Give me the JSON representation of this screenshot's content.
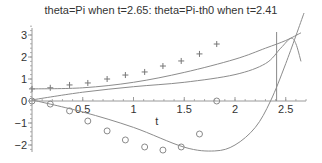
{
  "chart_data": {
    "type": "line",
    "title": "theta=Pi when t=2.65:  theta=Pi-th0 when t=2.41",
    "xlabel": "t",
    "ylabel": "",
    "xlim": [
      0,
      2.7
    ],
    "ylim": [
      -2.2,
      3.4
    ],
    "x_ticks": [
      "0.5",
      "1",
      "1.5",
      "2",
      "2.5"
    ],
    "y_ticks": [
      "3",
      "2",
      "1",
      "0",
      "-1",
      "-2"
    ],
    "grid": false,
    "legend": null,
    "vertical_line": {
      "t": 2.41
    },
    "series": [
      {
        "name": "plus markers",
        "style": "markers-plus",
        "x": [
          0.0,
          0.18,
          0.37,
          0.55,
          0.74,
          0.92,
          1.11,
          1.29,
          1.47,
          1.65,
          1.82
        ],
        "values": [
          0.55,
          0.6,
          0.73,
          0.82,
          1.0,
          1.18,
          1.32,
          1.59,
          1.82,
          2.14,
          2.59
        ]
      },
      {
        "name": "circle markers",
        "style": "markers-circle",
        "x": [
          0.0,
          0.18,
          0.37,
          0.55,
          0.74,
          0.92,
          1.11,
          1.29,
          1.47,
          1.65,
          1.82
        ],
        "values": [
          0.0,
          -0.14,
          -0.45,
          -0.91,
          -1.36,
          -1.77,
          -2.09,
          -2.23,
          -2.09,
          -1.5,
          0.0
        ]
      },
      {
        "name": "upper curve",
        "style": "line",
        "x": [
          0.0,
          0.5,
          1.0,
          1.5,
          2.0,
          2.3,
          2.5,
          2.65
        ],
        "values": [
          0.55,
          0.6,
          0.85,
          1.3,
          1.9,
          2.4,
          2.75,
          3.1
        ]
      },
      {
        "name": "middle curve",
        "style": "line",
        "x": [
          0.0,
          0.5,
          1.0,
          1.5,
          2.0,
          2.3,
          2.45,
          2.55,
          2.6,
          2.65
        ],
        "values": [
          0.05,
          0.4,
          0.65,
          0.85,
          1.2,
          1.7,
          2.4,
          2.85,
          2.6,
          1.8
        ]
      },
      {
        "name": "lower curve",
        "style": "line",
        "x": [
          0.0,
          0.5,
          1.0,
          1.5,
          1.8,
          2.0,
          2.2,
          2.35,
          2.5,
          2.68
        ],
        "values": [
          0.05,
          -0.5,
          -1.2,
          -2.1,
          -2.27,
          -2.0,
          -1.2,
          0.0,
          1.7,
          4.0
        ]
      }
    ]
  }
}
